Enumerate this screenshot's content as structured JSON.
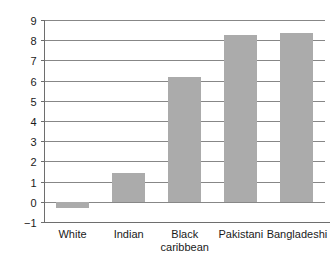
{
  "chart_data": {
    "type": "bar",
    "title": "",
    "subtitle": "",
    "xlabel": "",
    "ylabel": "",
    "categories": [
      "White",
      "Indian",
      "Black caribbean",
      "Pakistani",
      "Bangladeshi"
    ],
    "category_lines": [
      [
        "White"
      ],
      [
        "Indian"
      ],
      [
        "Black",
        "caribbean"
      ],
      [
        "Pakistani"
      ],
      [
        "Bangladeshi"
      ]
    ],
    "values": [
      -0.3,
      1.45,
      6.2,
      8.25,
      8.35
    ],
    "ylim": [
      -1,
      9
    ],
    "yticks": [
      -1,
      0,
      1,
      2,
      3,
      4,
      5,
      6,
      7,
      8,
      9
    ],
    "ytick_labels": [
      "−1",
      "0",
      "1",
      "2",
      "3",
      "4",
      "5",
      "6",
      "7",
      "8",
      "9"
    ],
    "grid": true,
    "grid_axis": "y",
    "legend": false,
    "legend_position": "none",
    "orientation": "vertical",
    "bar_color": "#ababab",
    "grid_color": "#878787",
    "axis_color": "#6e6e6e",
    "text_color": "#1a1a1a",
    "background_color": "#ffffff"
  }
}
